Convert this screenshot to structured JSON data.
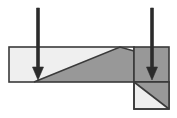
{
  "figure": {
    "canvas": {
      "width": 177,
      "height": 118,
      "background": "#ffffff"
    },
    "colors": {
      "light_fill": "#efefef",
      "dark_fill": "#989898",
      "outline": "#3a3a3a",
      "arrow": "#2b2b2b",
      "background": "#ffffff"
    },
    "shapes": [
      {
        "name": "beam-light-region",
        "label": "Beam upper-left light region",
        "fill": "#efefef",
        "points": "9,47 120,47 34,82 9,82"
      },
      {
        "name": "beam-dark-region",
        "label": "Beam lower-right dark region",
        "fill": "#989898",
        "points": "120,47 134,51 134,82 34,82"
      },
      {
        "name": "beam-outline",
        "label": "Beam outer rectangle outline",
        "stroke": "#3a3a3a",
        "x": 9,
        "y": 47,
        "width": 125,
        "height": 35
      },
      {
        "name": "beam-shear-plane",
        "label": "Beam diagonal shear plane",
        "stroke": "#3a3a3a",
        "points": "34,82 120,47 134,51"
      },
      {
        "name": "support-upper-block",
        "label": "Upper right support block (dark)",
        "fill": "#989898",
        "stroke": "#3a3a3a",
        "x": 134,
        "y": 47,
        "width": 35,
        "height": 35
      },
      {
        "name": "support-lower-block",
        "label": "Lower right support block",
        "fill": "#efefef",
        "stroke": "#3a3a3a",
        "x": 134,
        "y": 82,
        "width": 35,
        "height": 27
      },
      {
        "name": "support-lower-dark-triangle",
        "label": "Lower block upper-right dark triangle",
        "fill": "#989898",
        "points": "134,82 169,82 169,109"
      },
      {
        "name": "support-lower-shear-plane",
        "label": "Lower block diagonal shear plane",
        "stroke": "#3a3a3a",
        "points": "134,82 169,109"
      }
    ],
    "arrows": [
      {
        "name": "load-arrow-left",
        "label": "Left downward load arrow",
        "color": "#2b2b2b",
        "x": 38,
        "y_start": 8,
        "y_end": 80,
        "shaft_width": 3,
        "head_width": 11,
        "head_length": 13
      },
      {
        "name": "load-arrow-right",
        "label": "Right downward load arrow",
        "color": "#2b2b2b",
        "x": 152,
        "y_start": 8,
        "y_end": 80,
        "shaft_width": 3,
        "head_width": 11,
        "head_length": 13
      }
    ]
  }
}
